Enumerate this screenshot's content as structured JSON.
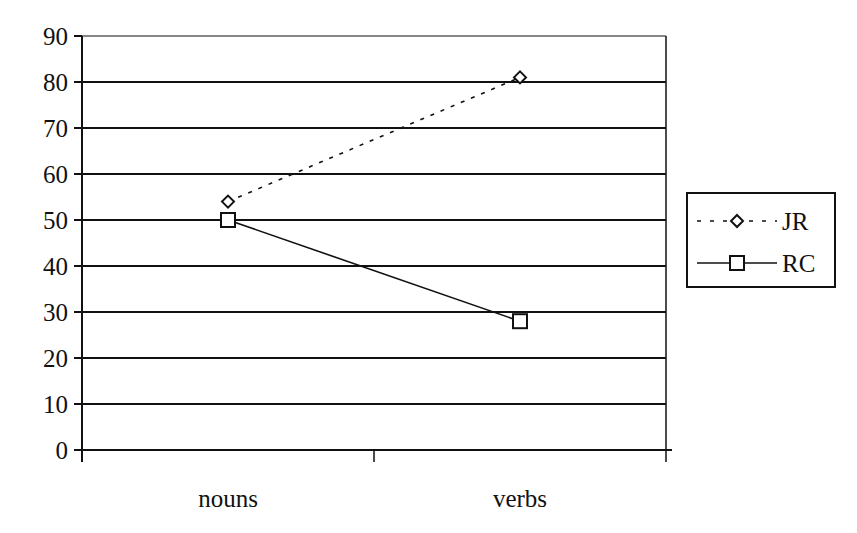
{
  "chart_data": {
    "type": "line",
    "title": "",
    "xlabel": "",
    "ylabel": "",
    "categories": [
      "nouns",
      "verbs"
    ],
    "series": [
      {
        "name": "JR",
        "values": [
          54,
          81
        ],
        "line_style": "dotted",
        "marker": "diamond"
      },
      {
        "name": "RC",
        "values": [
          50,
          28
        ],
        "line_style": "solid",
        "marker": "square"
      }
    ],
    "ylim": [
      0,
      90
    ],
    "yticks": [
      0,
      10,
      20,
      30,
      40,
      50,
      60,
      70,
      80,
      90
    ],
    "grid": true,
    "legend_position": "right"
  },
  "colors": {
    "line": "#111111",
    "background": "#ffffff"
  }
}
